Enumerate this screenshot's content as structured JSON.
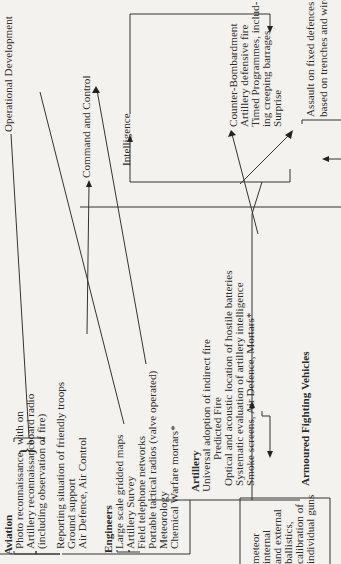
{
  "diagram": {
    "targets": {
      "operational_development": "Operational Development",
      "command_and_control": "Command and Control",
      "intelligence": "Intelligence"
    },
    "aviation": {
      "heading": "Aviation",
      "items": [
        "Photo reconnaissance",
        "Artillery reconnaissance",
        "(including observation of fire)"
      ],
      "brace_note": [
        "with on",
        "board radio"
      ],
      "brace_glyph": "}",
      "items2": [
        "Reporting situation of friendly troops",
        "Ground support",
        "Air Defence, Air Control"
      ]
    },
    "engineers": {
      "heading": "Engineers",
      "items": [
        "Large scale gridded maps",
        "Artillery Survey",
        "Field telephone networks",
        "Portable tactical radios (valve operated)",
        "Meteorology",
        "Chemical Warfare mortars*"
      ]
    },
    "artillery": {
      "heading": "Artillery",
      "items": [
        "Universal adoption of indirect fire",
        "Predicted Fire",
        "Optical and acoustic location of hostile batteries",
        "Systematic evaluation of artillery intelligence",
        "Smoke screens, Air Defence, Mortars*"
      ]
    },
    "armoured": {
      "heading": "Armoured Fighting Vehicles"
    },
    "meteor_block": {
      "items": [
        "meteor",
        "internal",
        "and external",
        "ballistics,",
        "calibration of",
        "individual guns"
      ]
    },
    "counter_bombardment": {
      "items": [
        "Counter-Bombardment",
        "Artillery defensive fire",
        "Timed Programmes, includ-",
        "ing creeping barrages",
        "Surprise"
      ]
    },
    "assault": {
      "items": [
        "Assault on fixed defences",
        "based on trenches and wire,"
      ]
    }
  }
}
